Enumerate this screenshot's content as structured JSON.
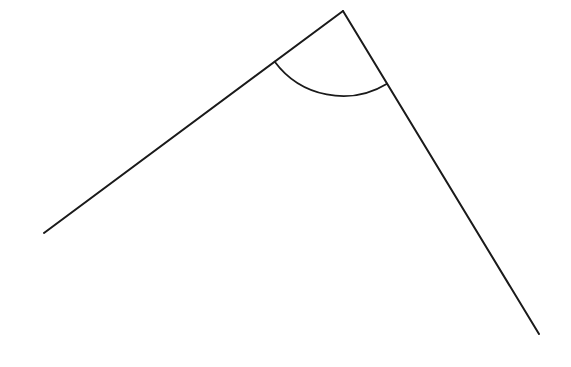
{
  "figure": {
    "kind": "geometry-angle-diagram",
    "canvas": {
      "width": 571,
      "height": 367,
      "background_color": "#ffffff"
    },
    "style": {
      "stroke_color": "#1a1a1a",
      "ray_stroke_width": 2,
      "arc_stroke_width": 1.8
    },
    "vertex": {
      "label": "apex",
      "x": 343,
      "y": 11
    },
    "rays": [
      {
        "name": "left-ray",
        "from_x": 343,
        "from_y": 11,
        "to_x": 44,
        "to_y": 233,
        "length": 372,
        "bearing_degrees": 143.4
      },
      {
        "name": "right-ray",
        "from_x": 343,
        "from_y": 11,
        "to_x": 539,
        "to_y": 334,
        "length": 378,
        "bearing_degrees": 55.6
      }
    ],
    "arc": {
      "name": "angle-arc",
      "center_x": 343,
      "center_y": 11,
      "radius": 85,
      "start_x": 275.5,
      "start_y": 62.6,
      "end_x": 413.9,
      "end_y": 84.2,
      "sweep_degrees": 87.8,
      "start_angle_degrees": 143.4,
      "end_angle_degrees": 55.6
    },
    "measurements": {
      "interior_angle_degrees": 88,
      "interior_angle_text": "≈88°"
    }
  }
}
